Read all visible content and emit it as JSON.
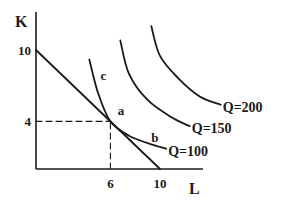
{
  "chart_data": {
    "type": "line",
    "title": "",
    "xlabel": "L",
    "ylabel": "K",
    "xlim": [
      0,
      14
    ],
    "ylim": [
      0,
      12.5
    ],
    "grid": false,
    "x_ticks": [
      {
        "value": 6,
        "label": "6"
      },
      {
        "value": 10,
        "label": "10"
      }
    ],
    "y_ticks": [
      {
        "value": 4,
        "label": "4"
      },
      {
        "value": 10,
        "label": "10"
      }
    ],
    "series": [
      {
        "name": "isocost",
        "label": "",
        "style": "solid",
        "points": [
          [
            0,
            10
          ],
          [
            10,
            0
          ]
        ]
      },
      {
        "name": "Q=100",
        "label": "Q=100",
        "style": "solid",
        "points": [
          [
            4.3,
            9.2
          ],
          [
            5.0,
            6.4
          ],
          [
            6.0,
            4.0
          ],
          [
            7.5,
            2.8
          ],
          [
            9.5,
            2.0
          ],
          [
            10.5,
            1.7
          ]
        ]
      },
      {
        "name": "Q=150",
        "label": "Q=150",
        "style": "solid",
        "points": [
          [
            6.8,
            10.8
          ],
          [
            7.5,
            8.0
          ],
          [
            9.0,
            5.8
          ],
          [
            11.0,
            4.3
          ],
          [
            12.4,
            3.6
          ]
        ]
      },
      {
        "name": "Q=200",
        "label": "Q=200",
        "style": "solid",
        "points": [
          [
            9.3,
            12.0
          ],
          [
            10.0,
            9.5
          ],
          [
            11.5,
            7.6
          ],
          [
            13.2,
            6.1
          ],
          [
            14.9,
            5.4
          ]
        ]
      },
      {
        "name": "guide-horizontal",
        "label": "",
        "style": "dashed",
        "points": [
          [
            0,
            4
          ],
          [
            6,
            4
          ]
        ]
      },
      {
        "name": "guide-vertical",
        "label": "",
        "style": "dashed",
        "points": [
          [
            6,
            0
          ],
          [
            6,
            4
          ]
        ]
      }
    ],
    "annotations": [
      {
        "text": "a",
        "x": 6.6,
        "y": 4.5
      },
      {
        "text": "b",
        "x": 9.3,
        "y": 2.3
      },
      {
        "text": "c",
        "x": 5.2,
        "y": 7.5
      }
    ]
  }
}
